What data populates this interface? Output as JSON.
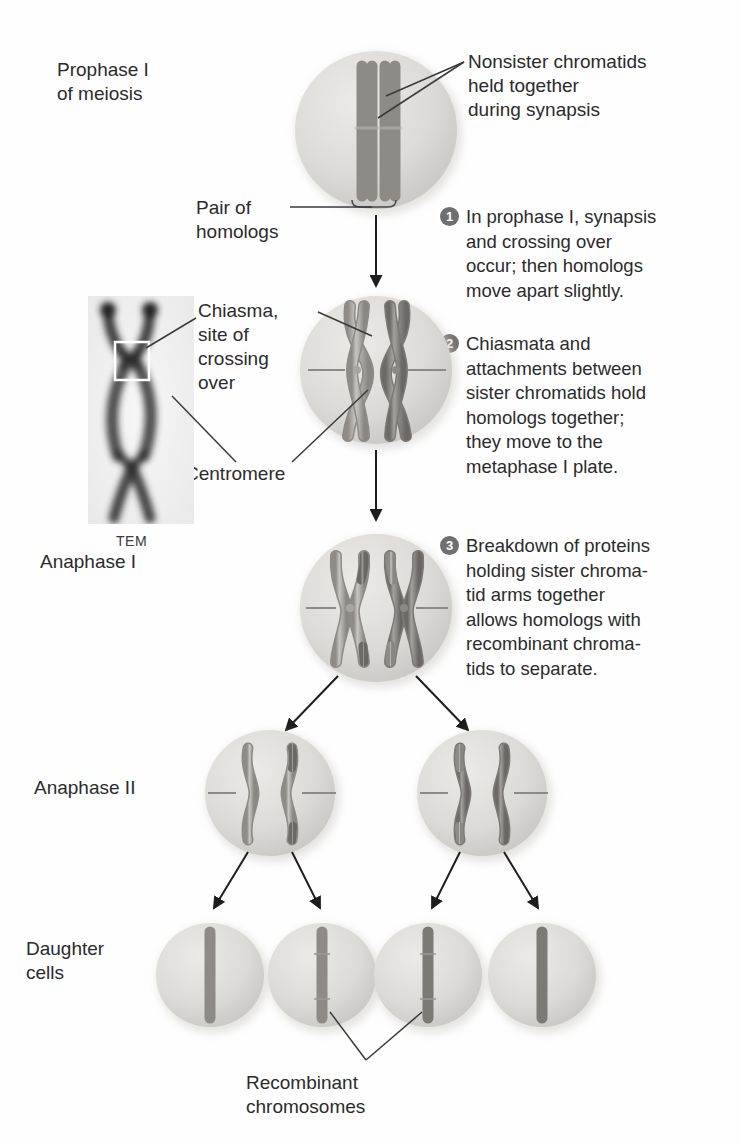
{
  "figure": {
    "type": "biology-diagram",
    "topic": "Crossing over and recombinant chromosomes in meiosis"
  },
  "stage_labels": {
    "prophase": "Prophase I\nof meiosis",
    "anaphase_i": "Anaphase I",
    "anaphase_ii": "Anaphase II",
    "daughter": "Daughter\ncells"
  },
  "callouts": {
    "nonsister": "Nonsister chromatids\nheld together\nduring synapsis",
    "pair_of_homologs": "Pair of\nhomologs",
    "chiasma": "Chiasma,\nsite of\ncrossing\nover",
    "centromere": "Centromere",
    "recombinant": "Recombinant\nchromosomes"
  },
  "micrograph": {
    "caption": "TEM"
  },
  "steps": [
    {
      "number": "1",
      "text": "In prophase I, synapsis\nand crossing over\noccur; then homologs\nmove apart slightly."
    },
    {
      "number": "2",
      "text": "Chiasmata and\nattachments between\nsister chromatids hold\nhomologs together;\nthey move to the\nmetaphase I plate."
    },
    {
      "number": "3",
      "text": "Breakdown of proteins\nholding sister chroma-\ntid arms together\nallows homologs with\nrecombinant chroma-\ntids to separate."
    }
  ],
  "colors": {
    "text": "#2b2b2b",
    "badge_fill": "#6f6f6f",
    "badge_text": "#ffffff",
    "cell_fill": "#dcdcd9",
    "chromosome_light": "#b9b7b4",
    "chromosome_dark": "#8a8784",
    "leader_line": "#3a3a3a"
  }
}
